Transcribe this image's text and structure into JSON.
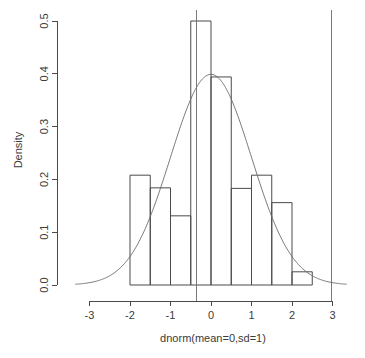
{
  "chart_data": {
    "type": "bar",
    "title": "",
    "subtitle": "",
    "xlabel": "dnorm(mean=0,sd=1)",
    "ylabel": "Density",
    "xlim": [
      -3.35,
      3.35
    ],
    "ylim": [
      0.0,
      0.5
    ],
    "xticks": [
      -3,
      -2,
      -1,
      0,
      1,
      2,
      3
    ],
    "xtick_labels": [
      "-3",
      "-2",
      "-1",
      "0",
      "1",
      "2",
      "3"
    ],
    "yticks": [
      0.0,
      0.1,
      0.2,
      0.3,
      0.4,
      0.5
    ],
    "ytick_labels": [
      "0.0",
      "0.1",
      "0.2",
      "0.3",
      "0.4",
      "0.5"
    ],
    "grid": false,
    "legend": null,
    "bin_width": 0.5,
    "bin_edges": [
      -2.0,
      -1.5,
      -1.0,
      -0.5,
      0.0,
      0.5,
      1.0,
      1.5,
      2.0,
      2.5
    ],
    "categories": [
      "-2.0 to -1.5",
      "-1.5 to -1.0",
      "-1.0 to -0.5",
      "-0.5 to 0.0",
      "0.0 to 0.5",
      "0.5 to 1.0",
      "1.0 to 1.5",
      "1.5 to 2.0",
      "2.0 to 2.5"
    ],
    "values": [
      0.208,
      0.184,
      0.131,
      0.5,
      0.394,
      0.183,
      0.208,
      0.156,
      0.025
    ],
    "overlay_curve": {
      "name": "normal density (mean=0, sd=1)",
      "type": "line",
      "mean": 0,
      "sd": 1,
      "peak": 0.399,
      "x_range": [
        -3.35,
        3.35
      ]
    },
    "vertical_reference_lines": [
      {
        "name": "left-reference-line",
        "x": -0.37
      },
      {
        "name": "right-reference-line",
        "x": 2.97
      }
    ]
  },
  "axes": {
    "y_axis_title": "Density",
    "x_axis_title": "dnorm(mean=0,sd=1)"
  },
  "colors": {
    "background": "#ffffff",
    "axis": "#4a4a4a",
    "bar_stroke": "#4a4a4a",
    "curve": "#6b6b6b",
    "reference_line": "#6d6d6d",
    "text": "#3b3b3b"
  }
}
